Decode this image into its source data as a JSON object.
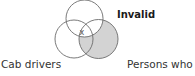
{
  "diagram": {
    "type": "venn-3-set",
    "verdict": "Invalid",
    "sets": [
      {
        "id": "top",
        "label": "",
        "cx": 84.5,
        "cy": 18.5,
        "r": 18.5
      },
      {
        "id": "left",
        "label": "Cab drivers",
        "cx": 74,
        "cy": 39,
        "r": 19
      },
      {
        "id": "right",
        "label": "Persons who eat",
        "cx": 98.5,
        "cy": 39,
        "r": 19.5
      }
    ],
    "marks": [
      {
        "symbol": "x",
        "x": 82,
        "y": 31,
        "region": "top ∩ left ∩ right"
      }
    ],
    "shaded_region": "right minus top",
    "colors": {
      "stroke": "#6b6b6b",
      "shade": "#d3d3d3",
      "mark": "#555555"
    }
  },
  "labels": {
    "verdict": "Invalid",
    "left_set": "Cab drivers",
    "right_set": "Persons who eat",
    "mark": "x"
  }
}
